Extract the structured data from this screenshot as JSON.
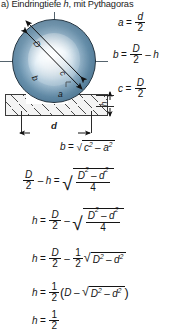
{
  "title": {
    "prefix": "a) Eindringtiefe ",
    "variable": "h",
    "suffix": ", mit Pythagoras"
  },
  "figure": {
    "caption_labels": {
      "diameter": "D",
      "b": "b",
      "c": "c",
      "a": "a",
      "depth": "h",
      "indent_diameter": "d"
    },
    "colors": {
      "sphere_light": "#f2f7fb",
      "sphere_mid": "#9fc0d6",
      "sphere_dark": "#6f9cba",
      "outline": "#20303c",
      "hatch": "#4a4a4a",
      "block_fill": "#f4f4f4"
    }
  },
  "equations": {
    "a_def": {
      "lhs": "a",
      "eq": "=",
      "num": "d",
      "den": "2"
    },
    "b_def": {
      "lhs": "b",
      "eq": "=",
      "num": "D",
      "den": "2",
      "op": "–",
      "term": "h"
    },
    "c_def": {
      "lhs": "c",
      "eq": "=",
      "num": "D",
      "den": "2"
    },
    "pythagoras": {
      "lhs": "b",
      "eq": "=",
      "radicand_left": "c",
      "sup_left": "2",
      "op": "–",
      "radicand_right": "a",
      "sup_right": "2"
    },
    "step1": {
      "lhs_num": "D",
      "lhs_den": "2",
      "lhs_op": "–",
      "lhs_term": "h",
      "eq": "=",
      "rad_num_left": "D",
      "rad_sup_left": "2",
      "rad_op": "–",
      "rad_num_right": "d",
      "rad_sup_right": "2",
      "rad_den": "4"
    },
    "step2": {
      "lhs": "h",
      "eq": "=",
      "t1_num": "D",
      "t1_den": "2",
      "op": "–",
      "rad_num_left": "D",
      "rad_sup_left": "2",
      "rad_op": "–",
      "rad_num_right": "d",
      "rad_sup_right": "2",
      "rad_den": "4"
    },
    "step3": {
      "lhs": "h",
      "eq": "=",
      "t1_num": "D",
      "t1_den": "2",
      "op": "–",
      "t2_num": "1",
      "t2_den": "2",
      "rad_left": "D",
      "rad_sup_left": "2",
      "rad_op": "–",
      "rad_right": "d",
      "rad_sup_right": "2"
    },
    "step4": {
      "lhs": "h",
      "eq": "=",
      "t1_num": "1",
      "t1_den": "2",
      "open": "(",
      "term": "D",
      "op": "–",
      "rad_left": "D",
      "rad_sup_left": "2",
      "rad_op": "–",
      "rad_right": "d",
      "rad_sup_right": "2",
      "close": ")"
    },
    "step5_partial": {
      "lhs": "h",
      "eq": "=",
      "t1_num": "1",
      "t1_den": "2"
    }
  }
}
